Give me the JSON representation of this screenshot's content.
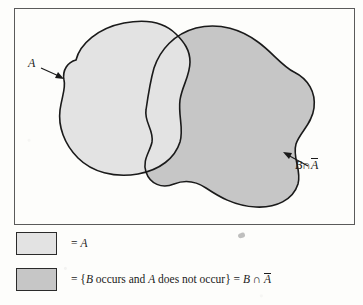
{
  "figure": {
    "type": "venn-diagram",
    "frame": {
      "label": "sample-space-frame"
    },
    "regions": [
      {
        "id": "A",
        "label": "A",
        "fill": "#e3e3e3",
        "stroke": "#1a1a1a",
        "description": "Light gray irregular blob on the left"
      },
      {
        "id": "B-minus-A",
        "label": "B ∩ Ā",
        "fill": "#c6c6c6",
        "stroke": "#1a1a1a",
        "description": "Darker gray irregular blob on the right, shaded only outside A"
      }
    ],
    "annotations": [
      {
        "id": "label-a",
        "text": "A",
        "has_arrow": true,
        "arrow_direction": "down-right",
        "points_to": "boundary of region A"
      },
      {
        "id": "label-b-int-abar",
        "text_parts": {
          "b": "B",
          "op": "∩",
          "abar": "A"
        },
        "overbar_on": "A",
        "has_arrow": true,
        "arrow_direction": "up-left",
        "points_to": "boundary of region B intersect A-complement"
      }
    ]
  },
  "legend": {
    "items": [
      {
        "swatch_id": "legend-swatch-light",
        "swatch_color": "#e3e3e3",
        "equals": "=",
        "text": "A",
        "text_parts": {
          "lead": "= ",
          "a": "A"
        }
      },
      {
        "swatch_id": "legend-swatch-dark",
        "swatch_color": "#c6c6c6",
        "equals": "=",
        "text": "= {B occurs and A does not occur} = B ∩ Ā",
        "text_parts": {
          "lead": "= {",
          "b": "B",
          "mid1": " occurs and ",
          "a": "A",
          "mid2": " does not occur} = ",
          "b2": "B",
          "op": " ∩ ",
          "abar": "A"
        }
      }
    ]
  },
  "colors": {
    "background": "#fdfdfb",
    "frame_border": "#5a5a5a",
    "region_a_fill": "#e3e3e3",
    "region_b_fill": "#c6c6c6",
    "outline": "#1a1a1a",
    "text": "#1a1a1a"
  }
}
